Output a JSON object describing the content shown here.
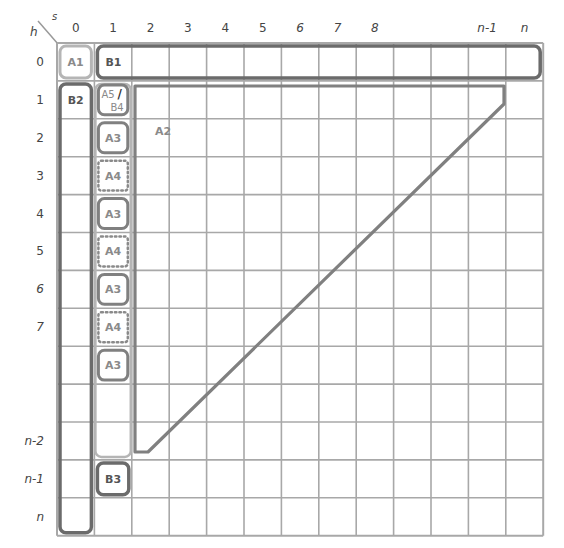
{
  "corner": {
    "row_axis": "h",
    "col_axis": "s"
  },
  "grid": {
    "left": 57,
    "top": 43,
    "cell_w": 37.4,
    "cell_h": 37.9,
    "cols": 13,
    "rows": 13,
    "line_color": "#a8a8a8",
    "border_color": "#9a9a9a"
  },
  "col_labels": [
    {
      "text": "0",
      "italic": false
    },
    {
      "text": "1",
      "italic": false
    },
    {
      "text": "2",
      "italic": false
    },
    {
      "text": "3",
      "italic": false
    },
    {
      "text": "4",
      "italic": false
    },
    {
      "text": "5",
      "italic": false
    },
    {
      "text": "6",
      "italic": true
    },
    {
      "text": "7",
      "italic": true
    },
    {
      "text": "8",
      "italic": true
    },
    {
      "text": "",
      "italic": false
    },
    {
      "text": "",
      "italic": false
    },
    {
      "text": "n-1",
      "italic": true
    },
    {
      "text": "n",
      "italic": true
    }
  ],
  "row_labels": [
    {
      "text": "0",
      "italic": false
    },
    {
      "text": "1",
      "italic": false
    },
    {
      "text": "2",
      "italic": false
    },
    {
      "text": "3",
      "italic": false
    },
    {
      "text": "4",
      "italic": false
    },
    {
      "text": "5",
      "italic": false
    },
    {
      "text": "6",
      "italic": true
    },
    {
      "text": "7",
      "italic": true
    },
    {
      "text": "",
      "italic": false
    },
    {
      "text": "",
      "italic": false
    },
    {
      "text": "n-2",
      "italic": true
    },
    {
      "text": "n-1",
      "italic": true
    },
    {
      "text": "n",
      "italic": true
    }
  ],
  "regions": [
    {
      "id": "A1",
      "label": "A1",
      "style": "light",
      "col": 0,
      "row": 0,
      "cspan": 1,
      "rspan": 1
    },
    {
      "id": "B1",
      "label": "B1",
      "style": "dark",
      "col": 1,
      "row": 0,
      "cspan": 12,
      "rspan": 1,
      "label_align": "left"
    },
    {
      "id": "B2",
      "label": "B2",
      "style": "dark",
      "col": 0,
      "row": 1,
      "cspan": 1,
      "rspan": 12,
      "label_align": "top"
    },
    {
      "id": "col1-band",
      "label": "",
      "style": "light",
      "col": 1,
      "row": 1,
      "cspan": 1,
      "rspan": 10
    },
    {
      "id": "A5-B4",
      "label": "A5/B4",
      "style": "mid",
      "col": 1,
      "row": 1,
      "cspan": 1,
      "rspan": 1
    },
    {
      "id": "A3-r2",
      "label": "A3",
      "style": "mid",
      "col": 1,
      "row": 2,
      "cspan": 1,
      "rspan": 1
    },
    {
      "id": "A4-r3",
      "label": "A4",
      "style": "dotted",
      "col": 1,
      "row": 3,
      "cspan": 1,
      "rspan": 1
    },
    {
      "id": "A3-r4",
      "label": "A3",
      "style": "mid",
      "col": 1,
      "row": 4,
      "cspan": 1,
      "rspan": 1
    },
    {
      "id": "A4-r5",
      "label": "A4",
      "style": "dotted",
      "col": 1,
      "row": 5,
      "cspan": 1,
      "rspan": 1
    },
    {
      "id": "A3-r6",
      "label": "A3",
      "style": "mid",
      "col": 1,
      "row": 6,
      "cspan": 1,
      "rspan": 1
    },
    {
      "id": "A4-r7",
      "label": "A4",
      "style": "dotted",
      "col": 1,
      "row": 7,
      "cspan": 1,
      "rspan": 1
    },
    {
      "id": "A3-r8",
      "label": "A3",
      "style": "mid",
      "col": 1,
      "row": 8,
      "cspan": 1,
      "rspan": 1
    },
    {
      "id": "B3",
      "label": "B3",
      "style": "dark",
      "col": 1,
      "row": 11,
      "cspan": 1,
      "rspan": 1
    }
  ],
  "a2_region": {
    "label": "A2",
    "label_pos": {
      "x": 155,
      "y": 135
    },
    "points": [
      [
        135,
        86
      ],
      [
        504,
        86
      ],
      [
        504,
        104
      ],
      [
        148,
        452
      ],
      [
        135,
        452
      ]
    ]
  },
  "colors": {
    "dark": "#6b6b6b",
    "mid": "#808080",
    "light": "#b5b5b5",
    "dotted": "#8a8a8a",
    "text_dark": "#555555",
    "text_light": "#8a8a8a"
  }
}
